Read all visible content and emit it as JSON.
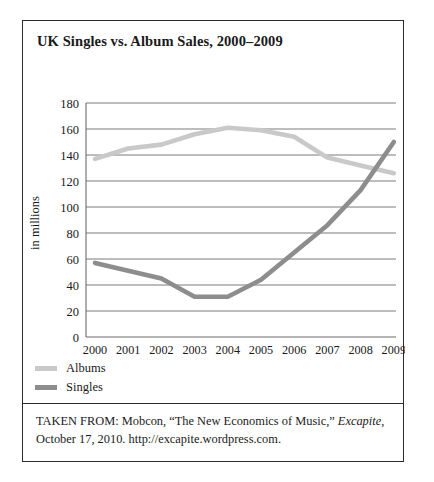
{
  "figure": {
    "title": "UK Singles vs. Album Sales, 2000–2009",
    "caption_line1_prefix": "TAKEN FROM: Mobcon, “The New Economics of Music,” ",
    "caption_italic": "Excapite",
    "caption_line1_suffix": ",",
    "caption_line2": "October 17, 2010. http://excapite.wordpress.com."
  },
  "legend": {
    "position": "below-plot-left",
    "items": [
      {
        "label": "Albums",
        "color": "#c9c9c9"
      },
      {
        "label": "Singles",
        "color": "#8d8d8d"
      }
    ]
  },
  "colors": {
    "albums": "#c9c9c9",
    "singles": "#8d8d8d",
    "gridline": "#6b6b6b",
    "axis": "#6b6b6b",
    "frame": "#2b2b2b",
    "text": "#1a1a1a"
  },
  "chart_data": {
    "type": "line",
    "title": "UK Singles vs. Album Sales, 2000–2009",
    "xlabel": "",
    "ylabel": "in millions",
    "categories": [
      "2000",
      "2001",
      "2002",
      "2003",
      "2004",
      "2005",
      "2006",
      "2007",
      "2008",
      "2009"
    ],
    "x_tick_labels": [
      "2000",
      "2001",
      "2002",
      "2003",
      "2004",
      "2005",
      "2006",
      "2007",
      "2008",
      "2009"
    ],
    "y_tick_labels": [
      "0",
      "20",
      "40",
      "60",
      "80",
      "100",
      "120",
      "140",
      "160",
      "180"
    ],
    "y_ticks": [
      0,
      20,
      40,
      60,
      80,
      100,
      120,
      140,
      160,
      180
    ],
    "ylim": [
      0,
      180
    ],
    "grid": "horizontal",
    "legend_position": "below",
    "series": [
      {
        "name": "Albums",
        "color": "#c9c9c9",
        "values": [
          137,
          145,
          148,
          156,
          161,
          159,
          154,
          138,
          132,
          126
        ]
      },
      {
        "name": "Singles",
        "color": "#8d8d8d",
        "values": [
          57,
          51,
          45,
          31,
          31,
          44,
          65,
          86,
          113,
          150
        ]
      }
    ]
  }
}
